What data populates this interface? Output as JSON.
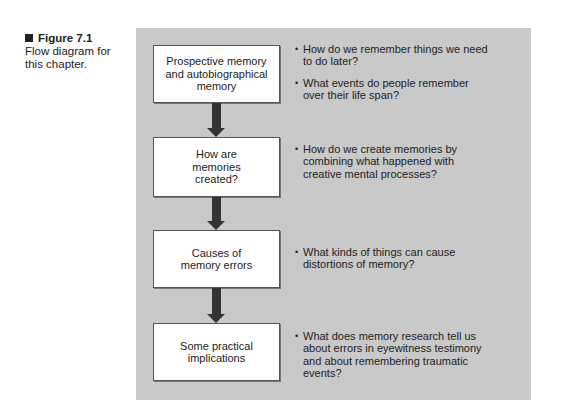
{
  "caption": {
    "label": "Figure 7.1",
    "text": "Flow diagram for this chapter."
  },
  "colors": {
    "panel_background": "#c9c9c9",
    "box_background": "#ffffff",
    "arrow": "#333333"
  },
  "flow": [
    {
      "box_label": "Prospective memory and autobiographical memory",
      "questions": [
        "How do we remember things we need to do later?",
        "What events do people remember over their life span?"
      ]
    },
    {
      "box_label": "How are memories created?",
      "questions": [
        "How do we create memories by combining what happened with creative mental processes?"
      ]
    },
    {
      "box_label": "Causes of memory errors",
      "questions": [
        "What kinds of things can cause distortions of memory?"
      ]
    },
    {
      "box_label": "Some practical implications",
      "questions": [
        "What does memory research tell us about errors in eyewitness testimony and about remembering traumatic events?"
      ]
    }
  ]
}
